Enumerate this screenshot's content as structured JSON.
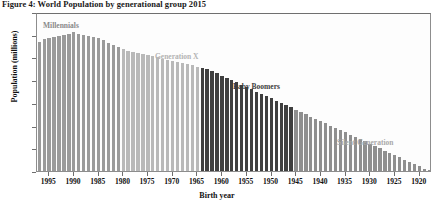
{
  "figure": {
    "title": "Figure 4: World Population by generational group 2015"
  },
  "axes": {
    "y_title": "Population (millions)",
    "x_title": "Birth year",
    "y_ticks": [
      0,
      20,
      40,
      60,
      80,
      100,
      120,
      140
    ],
    "x_ticks": [
      1995,
      1990,
      1985,
      1980,
      1975,
      1970,
      1965,
      1960,
      1955,
      1950,
      1945,
      1940,
      1935,
      1930,
      1925,
      1920
    ]
  },
  "generations": [
    {
      "name": "Millennials",
      "label": "Millennials",
      "color": "#9a9a9a",
      "years": [
        1997,
        1981
      ]
    },
    {
      "name": "Generation X",
      "label": "Generation X",
      "color": "#b9b9b9",
      "years": [
        1980,
        1965
      ]
    },
    {
      "name": "Baby Boomers",
      "label": "Baby Boomers",
      "color": "#3f3f3f",
      "years": [
        1964,
        1946
      ]
    },
    {
      "name": "Silent Generation",
      "label": "Silent Generation",
      "color": "#8f8f8f",
      "years": [
        1945,
        1918
      ]
    }
  ],
  "chart_data": {
    "type": "bar",
    "title": "Figure 4: World Population by generational group 2015",
    "xlabel": "Birth year",
    "ylabel": "Population (millions)",
    "ylim": [
      0,
      140
    ],
    "grid": false,
    "legend": "inline annotations",
    "x_axis_direction": "descending",
    "categories": [
      1997,
      1996,
      1995,
      1994,
      1993,
      1992,
      1991,
      1990,
      1989,
      1988,
      1987,
      1986,
      1985,
      1984,
      1983,
      1982,
      1981,
      1980,
      1979,
      1978,
      1977,
      1976,
      1975,
      1974,
      1973,
      1972,
      1971,
      1970,
      1969,
      1968,
      1967,
      1966,
      1965,
      1964,
      1963,
      1962,
      1961,
      1960,
      1959,
      1958,
      1957,
      1956,
      1955,
      1954,
      1953,
      1952,
      1951,
      1950,
      1949,
      1948,
      1947,
      1946,
      1945,
      1944,
      1943,
      1942,
      1941,
      1940,
      1939,
      1938,
      1937,
      1936,
      1935,
      1934,
      1933,
      1932,
      1931,
      1930,
      1929,
      1928,
      1927,
      1926,
      1925,
      1924,
      1923,
      1922,
      1921,
      1920,
      1919,
      1918
    ],
    "values": [
      114,
      116,
      117,
      118,
      119,
      120,
      121,
      122,
      121,
      120,
      119,
      118,
      117,
      115,
      113,
      111,
      109,
      107,
      106,
      105,
      104,
      103,
      102,
      101,
      100,
      99,
      98,
      97,
      96,
      95,
      94,
      93,
      92,
      91,
      90,
      88,
      86,
      84,
      82,
      80,
      78,
      76,
      74,
      72,
      70,
      68,
      66,
      64,
      62,
      60,
      58,
      56,
      54,
      52,
      50,
      48,
      46,
      44,
      42,
      40,
      38,
      36,
      34,
      32,
      30,
      28,
      26,
      24,
      22,
      20,
      18,
      16,
      14,
      12,
      10,
      8,
      6,
      4,
      2,
      1
    ],
    "series": [
      {
        "name": "Millennials",
        "color": "#9a9a9a",
        "x_range": [
          1997,
          1981
        ]
      },
      {
        "name": "Generation X",
        "color": "#b9b9b9",
        "x_range": [
          1980,
          1965
        ]
      },
      {
        "name": "Baby Boomers",
        "color": "#3f3f3f",
        "x_range": [
          1964,
          1946
        ]
      },
      {
        "name": "Silent Generation",
        "color": "#8f8f8f",
        "x_range": [
          1945,
          1918
        ]
      }
    ],
    "annotations": [
      {
        "text": "Millennials",
        "color": "#8a8a8a"
      },
      {
        "text": "Generation X",
        "color": "#b4b4b4"
      },
      {
        "text": "Baby Boomers",
        "color": "#3c3c3c"
      },
      {
        "text": "Silent Generation",
        "color": "#a9a9a9"
      }
    ]
  }
}
